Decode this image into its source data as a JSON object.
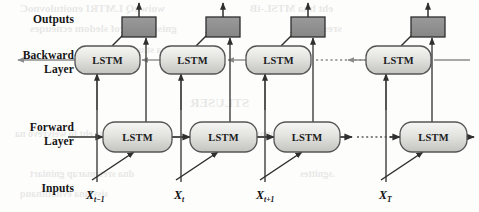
{
  "figure": {
    "type": "bidirectional-lstm-architecture-diagram",
    "background_color": "#fdfdfc",
    "stroke_color": "#3b3b3b",
    "lstm_fill_top": "#f2f2f0",
    "lstm_fill_bottom": "#c9c9c6",
    "output_box_fill": "#8e8e8e",
    "output_box_stroke": "#2e2e2e"
  },
  "row_labels": {
    "outputs": "Outputs",
    "backward_line1": "Backward",
    "backward_line2": "Layer",
    "forward_line1": "Forward",
    "forward_line2": "Layer",
    "inputs": "Inputs"
  },
  "cells": {
    "label": "LSTM",
    "columns": [
      {
        "id": "t-minus-1",
        "x_base": "X",
        "x_sub": "t−1",
        "cx": 107
      },
      {
        "id": "t",
        "x_base": "X",
        "x_sub": "t",
        "cx": 191
      },
      {
        "id": "t-plus-1",
        "x_base": "X",
        "x_sub": "t+1",
        "cx": 279
      },
      {
        "id": "T",
        "x_base": "X",
        "x_sub": "T",
        "cx": 400
      }
    ]
  },
  "connections": {
    "forward_direction": "left-to-right",
    "backward_direction": "right-to-left",
    "elided_span": "dotted",
    "output_arrow_direction": "up"
  }
}
